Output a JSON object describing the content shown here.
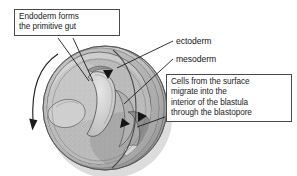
{
  "figure": {
    "background_color": "#ffffff",
    "line_color": "#2b2b2b",
    "box_border_color": "#4a4a4a",
    "text_color": "#1a1a1a"
  },
  "callouts": {
    "endoderm": {
      "text": "Endoderm forms\nthe primitive gut",
      "lines": [
        "Endoderm forms",
        "the primitive gut"
      ]
    },
    "cells": {
      "text": "Cells from the surface\nmigrate into the\ninterior of the blastula\nthrough the blastopore",
      "lines": [
        "Cells from the surface",
        "migrate into the",
        "interior of the blastula",
        "through the blastopore"
      ]
    }
  },
  "labels": {
    "ectoderm": "ectoderm",
    "mesoderm": "mesoderm"
  },
  "illustration": {
    "embryo_fill_light": "#d8d8d8",
    "embryo_fill_mid": "#b5b5b5",
    "embryo_fill_dark": "#8a8a8a",
    "embryo_shadow": "#6d6d6d",
    "archenteron_fill": "#c9c9c9",
    "stipple_color": "#7e7e7e",
    "arrow_color": "#1c1c1c",
    "arrows": [
      {
        "name": "surface-rotation-arrow",
        "position": "left-outer",
        "direction": "downward-curve"
      },
      {
        "name": "involution-arrow-top",
        "position": "dorsal-lip-top",
        "direction": "inward"
      },
      {
        "name": "involution-arrow-middle",
        "position": "blastopore-upper",
        "direction": "inward"
      },
      {
        "name": "involution-arrow-lower",
        "position": "blastopore-lower",
        "direction": "inward"
      }
    ]
  }
}
